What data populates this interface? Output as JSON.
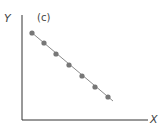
{
  "panel_label": "(c)",
  "axes": {
    "x_label": "X",
    "y_label": "Y"
  },
  "colors": {
    "axis": "#333333",
    "line": "#8a8a8a",
    "point": "#777777"
  },
  "chart_data": {
    "type": "line",
    "title": "(c)",
    "xlabel": "X",
    "ylabel": "Y",
    "grid": false,
    "x": [
      1,
      2,
      3,
      4,
      5,
      6,
      7
    ],
    "series": [
      {
        "name": "points",
        "values": [
          7,
          6,
          5,
          4,
          3,
          2,
          1
        ]
      }
    ],
    "pixel_points": [
      [
        32,
        33
      ],
      [
        44,
        43
      ],
      [
        56,
        54
      ],
      [
        69,
        65
      ],
      [
        82,
        76
      ],
      [
        95,
        87
      ],
      [
        108,
        97
      ]
    ]
  }
}
